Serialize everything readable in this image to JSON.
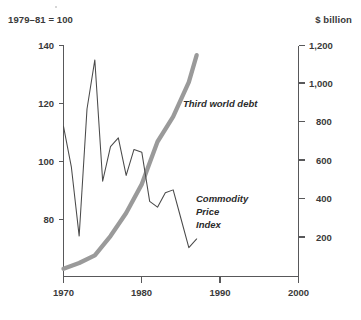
{
  "header": {
    "left_note": "1979–81 = 100",
    "right_note": "$ billion"
  },
  "chart_data": {
    "type": "line",
    "title": "",
    "subtitle": "",
    "xlabel": "",
    "ylabel": "1979–81 = 100",
    "y2label": "$ billion",
    "xlim": [
      1970,
      2000
    ],
    "xticks": [
      1970,
      1980,
      1990,
      2000
    ],
    "xticklabels": [
      "1970",
      "1980",
      "1990",
      "2000"
    ],
    "ylim": [
      60,
      140
    ],
    "yticks": [
      80,
      100,
      120,
      140
    ],
    "yticklabels": [
      "80",
      "100",
      "120",
      "140"
    ],
    "y2lim": [
      0,
      1200
    ],
    "y2ticks": [
      200,
      400,
      600,
      800,
      1000,
      1200
    ],
    "y2ticklabels": [
      "200",
      "400",
      "600",
      "800",
      "1,000",
      "1,200"
    ],
    "grid": false,
    "legend": "inline-annotations",
    "series": [
      {
        "name": "Commodity Price Index",
        "axis": "left",
        "label_lines": [
          "Commodity",
          "Price",
          "Index"
        ],
        "color": "#4a4a4a",
        "x": [
          1970,
          1971,
          1972,
          1973,
          1974,
          1975,
          1976,
          1977,
          1978,
          1979,
          1980,
          1981,
          1982,
          1983,
          1984,
          1985,
          1986,
          1987
        ],
        "values": [
          112,
          98,
          74,
          118,
          135,
          93,
          105,
          108,
          95,
          104,
          103,
          86,
          84,
          89,
          90,
          80,
          70,
          73
        ]
      },
      {
        "name": "Third world debt",
        "axis": "right",
        "label": "Third world debt",
        "color": "#9a9a9a",
        "x": [
          1970,
          1972,
          1974,
          1976,
          1978,
          1980,
          1982,
          1984,
          1986,
          1987
        ],
        "values": [
          40,
          70,
          110,
          210,
          330,
          480,
          700,
          830,
          1010,
          1150
        ]
      }
    ]
  },
  "axis_labels": {
    "y_left": [
      "140",
      "120",
      "100",
      "80"
    ],
    "y_right": [
      "1,200",
      "1,000",
      "800",
      "600",
      "400",
      "200"
    ],
    "x": [
      "1970",
      "1980",
      "1990",
      "2000"
    ]
  },
  "annotations": {
    "debt_label": "Third world debt",
    "cpi_label_line1": "Commodity",
    "cpi_label_line2": "Price",
    "cpi_label_line3": "Index"
  }
}
